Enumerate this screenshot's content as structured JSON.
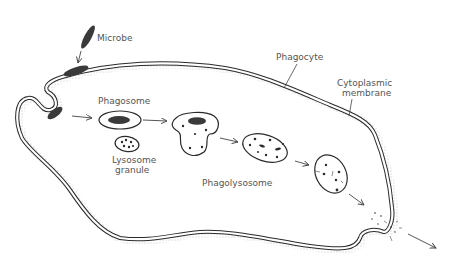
{
  "diagram": {
    "type": "phagocytosis process",
    "labels": {
      "microbe": "Microbe",
      "phagocyte": "Phagocyte",
      "cytoplasmic_membrane_line1": "Cytoplasmic",
      "cytoplasmic_membrane_line2": "membrane",
      "phagosome": "Phagosome",
      "lysosome_granule_line1": "Lysosome",
      "lysosome_granule_line2": "granule",
      "phagolysosome": "Phagolysosome"
    },
    "stages": [
      "Microbe approaches phagocyte",
      "Microbe attaches to membrane",
      "Membrane engulfs microbe",
      "Phagosome forms",
      "Phagosome fuses with lysosome granule",
      "Phagolysosome digests microbe",
      "Residual body",
      "Exocytosis of debris"
    ],
    "colors": {
      "ink": "#2a2a2a",
      "label_text": "#555555",
      "background": "#ffffff"
    }
  }
}
